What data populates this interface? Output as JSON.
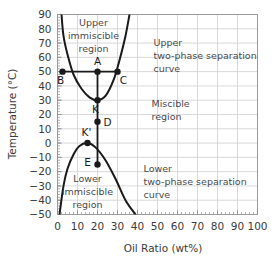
{
  "chart_data": {
    "type": "line",
    "title": "",
    "xlabel": "Oil Ratio (wt%)",
    "ylabel": "Temperature (°C)",
    "xlim": [
      0,
      100
    ],
    "ylim": [
      -50,
      90
    ],
    "grid": true,
    "legend": "none",
    "xticks": [
      "0",
      "10",
      "20",
      "30",
      "40",
      "50",
      "60",
      "70",
      "80",
      "90",
      "100"
    ],
    "xtick_values": [
      0,
      10,
      20,
      30,
      40,
      50,
      60,
      70,
      80,
      90,
      100
    ],
    "yticks": [
      "90",
      "80",
      "70",
      "60",
      "50",
      "40",
      "30",
      "20",
      "10",
      "0",
      "−10",
      "−20",
      "−30",
      "−40",
      "−50"
    ],
    "ytick_values": [
      90,
      80,
      70,
      60,
      50,
      40,
      30,
      20,
      10,
      0,
      -10,
      -20,
      -30,
      -40,
      -50
    ],
    "series": [
      {
        "name": "Upper two-phase separation curve",
        "shape": "upward-parabola",
        "vertex": [
          20,
          30
        ],
        "points": [
          [
            2.0,
            90
          ],
          [
            3.0,
            75
          ],
          [
            5.0,
            62
          ],
          [
            8.0,
            48
          ],
          [
            12.0,
            38
          ],
          [
            16.0,
            32
          ],
          [
            20.0,
            30
          ],
          [
            24.0,
            33
          ],
          [
            28.0,
            44
          ],
          [
            31.0,
            58
          ],
          [
            34.0,
            75
          ],
          [
            36.0,
            90
          ]
        ]
      },
      {
        "name": "Lower two-phase separation curve",
        "shape": "downward-parabola",
        "vertex": [
          15,
          0
        ],
        "points": [
          [
            1.0,
            -50
          ],
          [
            3.0,
            -30
          ],
          [
            5.0,
            -18
          ],
          [
            8.0,
            -8
          ],
          [
            11.0,
            -2
          ],
          [
            15.0,
            0
          ],
          [
            19.0,
            -3
          ],
          [
            24.0,
            -12
          ],
          [
            29.0,
            -25
          ],
          [
            34.0,
            -40
          ],
          [
            39.0,
            -50
          ]
        ]
      }
    ],
    "tie_lines": [
      {
        "name": "upper-tie-line",
        "from": [
          2.5,
          50
        ],
        "to": [
          30,
          50
        ]
      },
      {
        "name": "process-vertical-line",
        "from": [
          20,
          50
        ],
        "to": [
          20,
          -15
        ]
      }
    ],
    "markers": [
      {
        "label": "A",
        "x": 20,
        "y": 50,
        "label_dx": 0,
        "label_dy": -7
      },
      {
        "label": "B",
        "x": 2.5,
        "y": 50,
        "label_dx": -2,
        "label_dy": 12
      },
      {
        "label": "C",
        "x": 30,
        "y": 50,
        "label_dx": 6,
        "label_dy": 12
      },
      {
        "label": "K",
        "x": 20,
        "y": 30,
        "label_dx": -2,
        "label_dy": 13
      },
      {
        "label": "D",
        "x": 20,
        "y": 15,
        "label_dx": 10,
        "label_dy": 4
      },
      {
        "label": "K'",
        "x": 15,
        "y": 0,
        "label_dx": -1,
        "label_dy": -7
      },
      {
        "label": "E",
        "x": 20,
        "y": -15,
        "label_dx": -10,
        "label_dy": 1
      }
    ],
    "annotations": [
      {
        "name": "upper-immiscible-region",
        "lines": [
          "Upper",
          "immiscible",
          "region"
        ],
        "x": 18,
        "y": 82,
        "align": "middle"
      },
      {
        "name": "upper-two-phase-separation-curve",
        "lines": [
          "Upper",
          "two-phase separation",
          "curve"
        ],
        "x": 48,
        "y": 68,
        "align": "start"
      },
      {
        "name": "miscible-region",
        "lines": [
          "Miscible",
          "region"
        ],
        "x": 47,
        "y": 25,
        "align": "start"
      },
      {
        "name": "lower-two-phase-separation-curve",
        "lines": [
          "Lower",
          "two-phase separation",
          "curve"
        ],
        "x": 43,
        "y": -20,
        "align": "start"
      },
      {
        "name": "lower-immiscible-region",
        "lines": [
          "Lower",
          "immiscible",
          "region"
        ],
        "x": 15,
        "y": -27,
        "align": "middle"
      }
    ],
    "colors": {
      "curve": "#1a1a1a",
      "grid": "#d9d9d9",
      "axis": "#8c8c8c",
      "text": "#3b3b3b",
      "marker": "#1a1a1a",
      "background": "#ffffff"
    }
  },
  "axes": {
    "x_title": "Oil Ratio (wt%)",
    "y_title": "Temperature (°C)"
  }
}
